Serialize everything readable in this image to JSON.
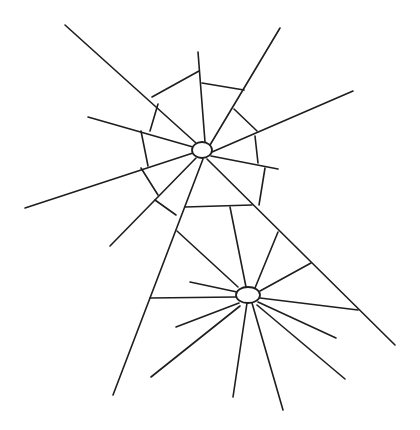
{
  "figure": {
    "stroke_color": "#1e1e1e",
    "background": "#ffffff"
  },
  "webs": [
    {
      "name": "upper-web",
      "hub": {
        "cx": 202,
        "cy": 150,
        "rx": 10,
        "ry": 8
      },
      "strands": [
        [
          65,
          25,
          196,
          143
        ],
        [
          198,
          52,
          205,
          142
        ],
        [
          280,
          28,
          210,
          145
        ],
        [
          353,
          91,
          212,
          152
        ],
        [
          88,
          117,
          193,
          147
        ],
        [
          25,
          208,
          193,
          153
        ],
        [
          278,
          169,
          211,
          156
        ],
        [
          196,
          158,
          110,
          246
        ],
        [
          203,
          159,
          113,
          395
        ],
        [
          152,
          97,
          199,
          71
        ],
        [
          202,
          83,
          244,
          90
        ],
        [
          234,
          109,
          257,
          131
        ],
        [
          255,
          136,
          258,
          163
        ],
        [
          265,
          168,
          259,
          205
        ],
        [
          185,
          207,
          252,
          205
        ],
        [
          158,
          104,
          150,
          131
        ],
        [
          141,
          131,
          148,
          166
        ],
        [
          141,
          168,
          158,
          195
        ],
        [
          155,
          200,
          176,
          215
        ]
      ]
    },
    {
      "name": "lower-web",
      "hub": {
        "cx": 248,
        "cy": 295,
        "rx": 12,
        "ry": 8
      },
      "strands": [
        [
          207,
          159,
          395,
          345
        ],
        [
          230,
          207,
          246,
          287
        ],
        [
          278,
          232,
          255,
          288
        ],
        [
          311,
          263,
          260,
          291
        ],
        [
          150,
          298,
          236,
          297
        ],
        [
          177,
          231,
          238,
          287
        ],
        [
          190,
          282,
          237,
          292
        ],
        [
          260,
          298,
          358,
          310
        ],
        [
          176,
          327,
          239,
          303
        ],
        [
          151,
          377,
          240,
          306
        ],
        [
          233,
          397,
          247,
          303
        ],
        [
          283,
          410,
          252,
          303
        ],
        [
          336,
          338,
          258,
          302
        ],
        [
          345,
          379,
          257,
          305
        ]
      ]
    }
  ]
}
